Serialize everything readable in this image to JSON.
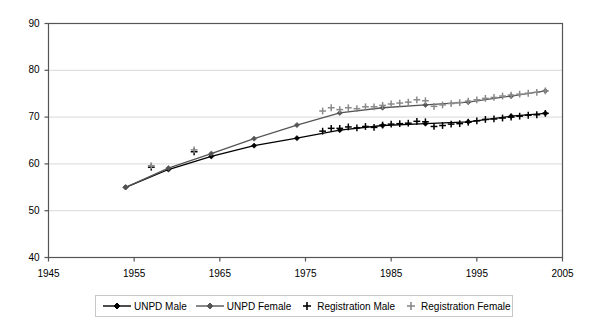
{
  "chart_data": {
    "type": "line",
    "title": "",
    "subtitle": "",
    "xlabel": "",
    "ylabel": "",
    "xlim": [
      1945,
      2005
    ],
    "ylim": [
      40,
      90
    ],
    "xticks": [
      1945,
      1955,
      1965,
      1975,
      1985,
      1995,
      2005
    ],
    "yticks": [
      40,
      50,
      60,
      70,
      80,
      90
    ],
    "grid": "horizontal",
    "legend_position": "bottom",
    "series": [
      {
        "name": "UNPD Male",
        "marker": "diamond",
        "line": true,
        "color": "#000000",
        "x": [
          1954,
          1959,
          1964,
          1969,
          1974,
          1979,
          1984,
          1989,
          1994,
          1999,
          2003
        ],
        "y": [
          55.0,
          58.8,
          61.6,
          63.9,
          65.5,
          67.2,
          68.2,
          68.6,
          69.0,
          70.2,
          70.8
        ]
      },
      {
        "name": "UNPD Female",
        "marker": "diamond",
        "line": true,
        "color": "#555555",
        "x": [
          1954,
          1959,
          1964,
          1969,
          1974,
          1979,
          1984,
          1989,
          1994,
          1999,
          2003
        ],
        "y": [
          55.0,
          59.1,
          62.2,
          65.4,
          68.3,
          70.9,
          72.0,
          72.6,
          73.2,
          74.5,
          75.6
        ]
      },
      {
        "name": "Registration Male",
        "marker": "plus",
        "line": false,
        "color": "#000000",
        "x": [
          1957,
          1962,
          1977,
          1978,
          1979,
          1980,
          1981,
          1982,
          1983,
          1984,
          1985,
          1986,
          1987,
          1988,
          1989,
          1990,
          1991,
          1992,
          1993,
          1994,
          1995,
          1996,
          1997,
          1998,
          1999,
          2000,
          2001,
          2002,
          2003
        ],
        "y": [
          59.3,
          62.6,
          67.0,
          67.6,
          67.6,
          67.9,
          67.7,
          68.0,
          67.8,
          68.3,
          68.5,
          68.6,
          68.7,
          69.1,
          69.0,
          68.0,
          68.2,
          68.5,
          68.6,
          68.9,
          69.2,
          69.5,
          69.6,
          69.8,
          70.0,
          70.2,
          70.4,
          70.5,
          70.8
        ]
      },
      {
        "name": "Registration Female",
        "marker": "plus",
        "line": false,
        "color": "#8a8a8a",
        "x": [
          1957,
          1962,
          1977,
          1978,
          1979,
          1980,
          1981,
          1982,
          1983,
          1984,
          1985,
          1986,
          1987,
          1988,
          1989,
          1990,
          1991,
          1992,
          1993,
          1994,
          1995,
          1996,
          1997,
          1998,
          1999,
          2000,
          2001,
          2002,
          2003
        ],
        "y": [
          59.6,
          63.0,
          71.3,
          72.0,
          71.6,
          72.0,
          71.8,
          72.2,
          72.2,
          72.5,
          72.8,
          73.0,
          73.2,
          73.7,
          73.5,
          72.3,
          72.6,
          72.9,
          73.1,
          73.4,
          73.7,
          74.0,
          74.2,
          74.5,
          74.7,
          74.9,
          75.1,
          75.3,
          75.6
        ]
      }
    ]
  },
  "legend": {
    "items": [
      {
        "label": "UNPD Male",
        "marker": "diamond-line",
        "color": "#000000"
      },
      {
        "label": "UNPD Female",
        "marker": "diamond-line",
        "color": "#555555"
      },
      {
        "label": "Registration Male",
        "marker": "plus",
        "color": "#000000"
      },
      {
        "label": "Registration Female",
        "marker": "plus",
        "color": "#8a8a8a"
      }
    ]
  },
  "colors": {
    "axis": "#555555",
    "grid": "#d9d9d9",
    "background": "#ffffff",
    "unpd_male": "#000000",
    "unpd_female": "#555555",
    "registration_male": "#000000",
    "registration_female": "#8a8a8a"
  }
}
